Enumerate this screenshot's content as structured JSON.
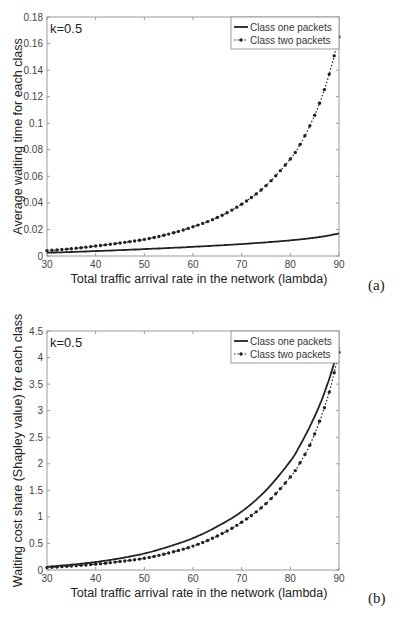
{
  "chart_data": [
    {
      "id": "a",
      "type": "line",
      "panel_label": "(a)",
      "title": "",
      "annotation": "k=0.5",
      "xlabel": "Total traffic arrival rate in the network (lambda)",
      "ylabel": "Average waiting time for each class",
      "xlim": [
        30,
        90
      ],
      "ylim": [
        0,
        0.18
      ],
      "xticks": [
        30,
        40,
        50,
        60,
        70,
        80,
        90
      ],
      "yticks": [
        0,
        0.02,
        0.04,
        0.06,
        0.08,
        0.1,
        0.12,
        0.14,
        0.16,
        0.18
      ],
      "ytick_labels": [
        "0",
        "0.02",
        "0.04",
        "0.06",
        "0.08",
        "0.1",
        "0.12",
        "0.14",
        "0.16",
        "0.18"
      ],
      "grid": false,
      "legend_position": "upper right",
      "x": [
        30,
        35,
        40,
        45,
        50,
        55,
        60,
        65,
        70,
        75,
        80,
        82,
        84,
        86,
        88,
        90
      ],
      "series": [
        {
          "name": "Class one packets",
          "style": "solid",
          "values": [
            0.0025,
            0.003,
            0.0037,
            0.0044,
            0.0052,
            0.006,
            0.0069,
            0.0079,
            0.009,
            0.0103,
            0.0118,
            0.0125,
            0.0133,
            0.0143,
            0.0155,
            0.017
          ]
        },
        {
          "name": "Class two packets",
          "style": "dotted-marker",
          "values": [
            0.004,
            0.0055,
            0.0075,
            0.0098,
            0.0125,
            0.0165,
            0.022,
            0.029,
            0.039,
            0.053,
            0.073,
            0.084,
            0.098,
            0.115,
            0.137,
            0.165
          ]
        }
      ]
    },
    {
      "id": "b",
      "type": "line",
      "panel_label": "(b)",
      "title": "",
      "annotation": "k=0.5",
      "xlabel": "Total traffic arrival rate in the network (lambda)",
      "ylabel": "Waiting cost share (Shapley value) for each class",
      "xlim": [
        30,
        90
      ],
      "ylim": [
        0,
        4.5
      ],
      "xticks": [
        30,
        40,
        50,
        60,
        70,
        80,
        90
      ],
      "yticks": [
        0,
        0.5,
        1,
        1.5,
        2,
        2.5,
        3,
        3.5,
        4,
        4.5
      ],
      "ytick_labels": [
        "0",
        "0.5",
        "1",
        "1.5",
        "2",
        "2.5",
        "3",
        "3.5",
        "4",
        "4.5"
      ],
      "grid": false,
      "legend_position": "upper right",
      "x": [
        30,
        35,
        40,
        45,
        50,
        55,
        60,
        65,
        70,
        75,
        80,
        82,
        84,
        86,
        88,
        90
      ],
      "series": [
        {
          "name": "Class one packets",
          "style": "solid",
          "values": [
            0.06,
            0.1,
            0.15,
            0.22,
            0.31,
            0.44,
            0.6,
            0.82,
            1.1,
            1.5,
            2.05,
            2.35,
            2.7,
            3.1,
            3.6,
            4.2
          ]
        },
        {
          "name": "Class two packets",
          "style": "dotted-marker",
          "values": [
            0.045,
            0.075,
            0.11,
            0.16,
            0.22,
            0.32,
            0.45,
            0.64,
            0.9,
            1.25,
            1.75,
            2.02,
            2.35,
            2.8,
            3.35,
            4.1
          ]
        }
      ]
    }
  ],
  "footer_text": "Fig. 2. Average waiting time and waiting cost share for each class versus the total traffic arrival rate"
}
